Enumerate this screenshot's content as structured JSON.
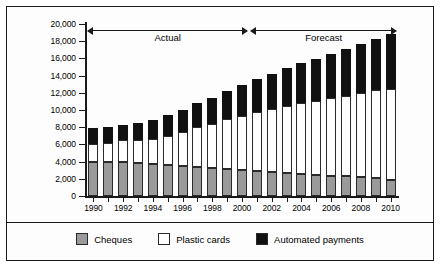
{
  "chart_data": {
    "type": "bar",
    "stacked": true,
    "title": "",
    "xlabel": "",
    "ylabel": "Volumes millions",
    "ylim": [
      0,
      20000
    ],
    "ytick_step": 2000,
    "ytick_labels": [
      "20,000",
      "18,000",
      "16,000",
      "14,000",
      "12,000",
      "10,000",
      "8,000",
      "6,000",
      "4,000",
      "2,000",
      "0"
    ],
    "ytick_values": [
      20000,
      18000,
      16000,
      14000,
      12000,
      10000,
      8000,
      6000,
      4000,
      2000,
      0
    ],
    "grid": false,
    "legend_position": "bottom",
    "categories": [
      1990,
      1991,
      1992,
      1993,
      1994,
      1995,
      1996,
      1997,
      1998,
      1999,
      2000,
      2001,
      2002,
      2003,
      2004,
      2005,
      2006,
      2007,
      2008,
      2009,
      2010
    ],
    "xtick_labels": [
      "1990",
      "",
      "1992",
      "",
      "1994",
      "",
      "1996",
      "",
      "1998",
      "",
      "2000",
      "",
      "2002",
      "",
      "2004",
      "",
      "2006",
      "",
      "2008",
      "",
      "2010"
    ],
    "series": [
      {
        "name": "Cheques",
        "color": "#9a9a9a",
        "values": [
          4000,
          3980,
          3950,
          3850,
          3720,
          3580,
          3450,
          3330,
          3220,
          3150,
          3050,
          2900,
          2780,
          2680,
          2570,
          2470,
          2380,
          2280,
          2180,
          2080,
          1900
        ]
      },
      {
        "name": "Plastic cards",
        "color": "#ffffff",
        "values": [
          2100,
          2150,
          2550,
          2700,
          2950,
          3400,
          4050,
          4700,
          5200,
          5800,
          6300,
          6900,
          7300,
          7800,
          8200,
          8600,
          9000,
          9400,
          9800,
          10200,
          10600
        ]
      },
      {
        "name": "Automated payments",
        "color": "#111111",
        "values": [
          1800,
          1950,
          1800,
          1900,
          2200,
          2400,
          2550,
          2750,
          3000,
          3250,
          3550,
          3800,
          4100,
          4350,
          4650,
          4900,
          5150,
          5450,
          5700,
          6000,
          6300
        ]
      }
    ],
    "totals": [
      7900,
      8080,
      8300,
      8450,
      8870,
      9380,
      10050,
      10780,
      11420,
      12200,
      12900,
      13600,
      14180,
      14830,
      15420,
      15970,
      16530,
      17130,
      17680,
      18280,
      18800
    ],
    "annotations": [
      {
        "label": "Actual",
        "from_category": 1990,
        "to_category": 2000
      },
      {
        "label": "Forecast",
        "from_category": 2001,
        "to_category": 2010
      }
    ]
  },
  "legend": {
    "items": [
      {
        "label": "Cheques",
        "color": "#9a9a9a"
      },
      {
        "label": "Plastic cards",
        "color": "#ffffff"
      },
      {
        "label": "Automated payments",
        "color": "#111111"
      }
    ]
  }
}
